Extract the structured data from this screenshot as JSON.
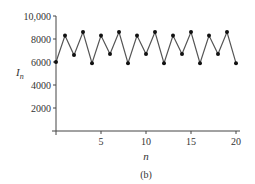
{
  "chart_data": {
    "type": "line",
    "title": "",
    "caption": "(b)",
    "xlabel": "n",
    "ylabel": "I",
    "ylabel_subscript": "n",
    "xlim": [
      0,
      20
    ],
    "ylim": [
      0,
      10000
    ],
    "x_ticks": [
      5,
      10,
      15,
      20
    ],
    "x_tick_labels": [
      "5",
      "10",
      "15",
      "20"
    ],
    "y_ticks": [
      2000,
      4000,
      6000,
      8000,
      10000
    ],
    "y_tick_labels": [
      "2000",
      "4000",
      "6000",
      "8000",
      "10,000"
    ],
    "grid": false,
    "markers": true,
    "series": [
      {
        "name": "I_n",
        "x": [
          0,
          1,
          2,
          3,
          4,
          5,
          6,
          7,
          8,
          9,
          10,
          11,
          12,
          13,
          14,
          15,
          16,
          17,
          18,
          19,
          20
        ],
        "values": [
          6000,
          8300,
          6600,
          8600,
          5900,
          8300,
          6700,
          8600,
          5900,
          8300,
          6700,
          8600,
          5900,
          8300,
          6700,
          8600,
          5900,
          8300,
          6700,
          8600,
          5900
        ]
      }
    ],
    "colors": {
      "line": "#555555",
      "marker": "#111111",
      "axis": "#444444"
    }
  }
}
